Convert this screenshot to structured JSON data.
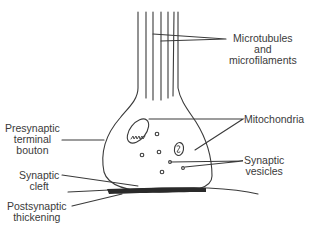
{
  "diagram": {
    "colors": {
      "line": "#3a3a3a",
      "text": "#3a3a3a",
      "thickening": "#2a2a2a",
      "background": "#ffffff"
    },
    "labels": {
      "microtubules": {
        "lines": [
          "Microtubules",
          "and",
          "microfilaments"
        ]
      },
      "mitochondria": {
        "lines": [
          "Mitochondria"
        ]
      },
      "presynaptic": {
        "lines": [
          "Presynaptic",
          "terminal",
          "bouton"
        ]
      },
      "vesicles": {
        "lines": [
          "Synaptic",
          "vesicles"
        ]
      },
      "cleft": {
        "lines": [
          "Synaptic",
          "cleft"
        ]
      },
      "postsynaptic": {
        "lines": [
          "Postsynaptic",
          "thickening"
        ]
      }
    }
  }
}
